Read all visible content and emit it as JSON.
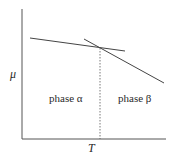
{
  "diagram": {
    "y_axis_label": "μ",
    "x_axis_label": "T",
    "regions": [
      {
        "label": "phase α"
      },
      {
        "label": "phase β"
      }
    ],
    "lines": [
      {
        "name": "phase-alpha-chemical-potential",
        "slope": "shallow negative"
      },
      {
        "name": "phase-beta-chemical-potential",
        "slope": "steep negative"
      }
    ],
    "transition_marker": "dashed vertical at crossing temperature T"
  }
}
